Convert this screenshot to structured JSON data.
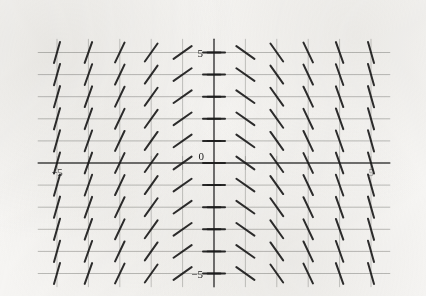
{
  "figure": {
    "kind": "slope-field",
    "title": "",
    "background_color": "#f6f5f3",
    "ink_color": "#1c1c1c",
    "grid_color": "#9b9b97"
  },
  "axes": {
    "x_axis_label": "",
    "y_axis_label": "",
    "origin_label": "0",
    "x_tick_labels": [
      {
        "value": -5,
        "text": "−5"
      },
      {
        "value": 0,
        "text": "0"
      },
      {
        "value": 5,
        "text": "5"
      }
    ],
    "y_tick_labels": [
      {
        "value": 5,
        "text": "5"
      },
      {
        "value": 0,
        "text": "0"
      },
      {
        "value": -5,
        "text": "−5"
      }
    ]
  },
  "chart_data": {
    "type": "scatter",
    "subtype": "slope-field",
    "title": "",
    "xlabel": "",
    "ylabel": "",
    "xlim": [
      -5.6,
      5.6
    ],
    "ylim": [
      -5.6,
      5.6
    ],
    "grid": true,
    "legend": null,
    "equation_displayed": "",
    "x": [
      -5,
      -4,
      -3,
      -2,
      -1,
      0,
      1,
      2,
      3,
      4,
      5
    ],
    "y": [
      5,
      4,
      3,
      2,
      1,
      0,
      -1,
      -2,
      -3,
      -4,
      -5
    ],
    "slope_rule": "dy/dx = -x",
    "slopes_by_x": [
      {
        "x": -5,
        "slope": 5
      },
      {
        "x": -4,
        "slope": 4
      },
      {
        "x": -3,
        "slope": 3
      },
      {
        "x": -2,
        "slope": 2
      },
      {
        "x": -1,
        "slope": 1
      },
      {
        "x": 0,
        "slope": 0
      },
      {
        "x": 1,
        "slope": -1
      },
      {
        "x": 2,
        "slope": -2
      },
      {
        "x": 3,
        "slope": -3
      },
      {
        "x": 4,
        "slope": -4
      },
      {
        "x": 5,
        "slope": -5
      }
    ]
  },
  "geometry": {
    "px_origin_x": 214,
    "px_origin_y": 163,
    "px_per_unit_x": 31.4,
    "px_per_unit_y": 22.1,
    "tick_len_px": 13
  }
}
